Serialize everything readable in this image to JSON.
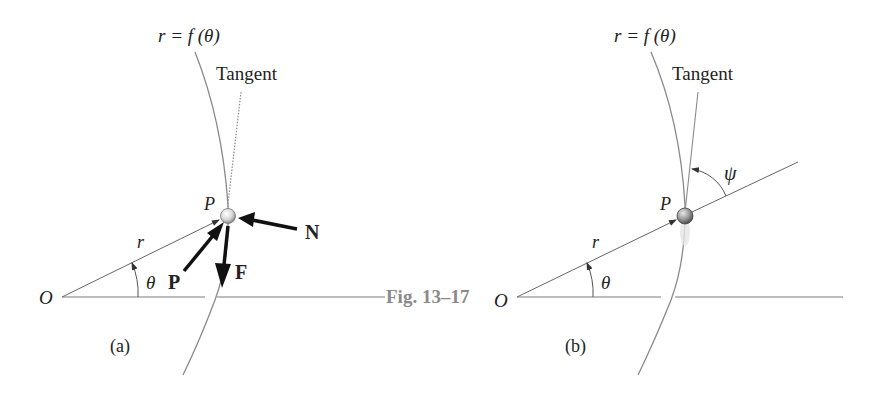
{
  "figure": {
    "caption": "Fig. 13–17",
    "panels": [
      {
        "id": "a",
        "sublabel": "(a)",
        "curve_label": "r = f (θ)",
        "tangent_label": "Tangent",
        "origin_label": "O",
        "radius_label": "r",
        "angle_label": "θ",
        "point_label": "P",
        "forces": [
          "P",
          "F",
          "N"
        ]
      },
      {
        "id": "b",
        "sublabel": "(b)",
        "curve_label": "r = f (θ)",
        "tangent_label": "Tangent",
        "origin_label": "O",
        "radius_label": "r",
        "angle_label": "θ",
        "point_label": "P",
        "tangent_angle_label": "ψ"
      }
    ]
  },
  "colors": {
    "line": "#7a7a7a",
    "arrow": "#111111",
    "caption": "#8a8a8a"
  }
}
